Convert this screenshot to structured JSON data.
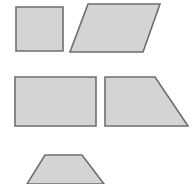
{
  "canvas": {
    "width": 193,
    "height": 184,
    "background": "#ffffff",
    "title": "Quadrilaterals figure"
  },
  "style": {
    "fill": "#d4d4d4",
    "stroke": "#6e6e6e",
    "stroke_width": 1.6,
    "stroke_linejoin": "miter"
  },
  "shapes": [
    {
      "id": "square",
      "label": "Square",
      "points": "16,7 63,7 63,51 16,51",
      "fill": "#d4d4d4",
      "stroke": "#6e6e6e"
    },
    {
      "id": "parallelogram",
      "label": "Parallelogram",
      "points": "88,4 160,4 143,52 70,52",
      "fill": "#d4d4d4",
      "stroke": "#6e6e6e"
    },
    {
      "id": "rectangle",
      "label": "Rectangle",
      "points": "15,77 96,77 96,126 15,126",
      "fill": "#d4d4d4",
      "stroke": "#6e6e6e"
    },
    {
      "id": "right-trapezoid",
      "label": "Right trapezoid",
      "points": "105,77 155,77 188,126 105,126",
      "fill": "#d4d4d4",
      "stroke": "#6e6e6e"
    },
    {
      "id": "isosceles-trapezoid",
      "label": "Isosceles trapezoid",
      "points": "45,155 82,155 104,184 27,184",
      "fill": "#d4d4d4",
      "stroke": "#6e6e6e"
    }
  ]
}
